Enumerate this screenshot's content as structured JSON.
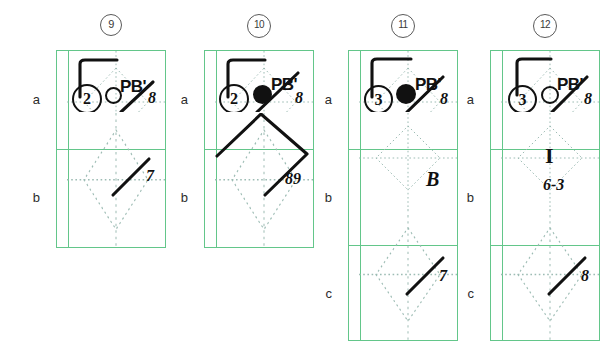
{
  "figure": {
    "title": "",
    "row_labels": [
      "a",
      "b",
      "c"
    ],
    "guide_color": "#9dbcb4",
    "frame_color": "#63c68a",
    "ink_color": "#111111"
  },
  "panels": [
    {
      "number": "9",
      "row_labels": [
        "a",
        "b"
      ],
      "cells": [
        {
          "row": "a",
          "marker_label": "PB'",
          "circled_digit": "2",
          "node_type": "open-circle",
          "corner_number": "8",
          "has_corner_slash": true,
          "has_hook": true,
          "shape": "none"
        },
        {
          "row": "b",
          "marker_label": "",
          "circled_digit": "",
          "node_type": "none",
          "corner_number": "7",
          "has_corner_slash": true,
          "has_hook": false,
          "shape": "none"
        }
      ]
    },
    {
      "number": "10",
      "row_labels": [
        "a",
        "b"
      ],
      "cells": [
        {
          "row": "a",
          "marker_label": "PB'",
          "circled_digit": "2",
          "node_type": "filled-circle",
          "corner_number": "8",
          "has_corner_slash": true,
          "has_hook": true,
          "shape": "none"
        },
        {
          "row": "b",
          "marker_label": "",
          "circled_digit": "",
          "node_type": "none",
          "corner_number": "89",
          "has_corner_slash": true,
          "has_hook": false,
          "shape": "diamond"
        }
      ]
    },
    {
      "number": "11",
      "row_labels": [
        "a",
        "b",
        "c"
      ],
      "cells": [
        {
          "row": "a",
          "marker_label": "PB'",
          "circled_digit": "3",
          "node_type": "filled-circle",
          "corner_number": "8",
          "has_corner_slash": true,
          "has_hook": true,
          "shape": "none"
        },
        {
          "row": "b",
          "marker_label": "",
          "circled_digit": "",
          "node_type": "none",
          "corner_number": "",
          "has_corner_slash": false,
          "has_hook": false,
          "shape": "none",
          "center_text": "B"
        },
        {
          "row": "c",
          "marker_label": "",
          "circled_digit": "",
          "node_type": "none",
          "corner_number": "7",
          "has_corner_slash": true,
          "has_hook": false,
          "shape": "none"
        }
      ]
    },
    {
      "number": "12",
      "row_labels": [
        "a",
        "b",
        "c"
      ],
      "cells": [
        {
          "row": "a",
          "marker_label": "PB'",
          "circled_digit": "3",
          "node_type": "open-circle",
          "corner_number": "8",
          "has_corner_slash": true,
          "has_hook": true,
          "shape": "none"
        },
        {
          "row": "b",
          "marker_label": "",
          "circled_digit": "",
          "node_type": "none",
          "corner_number": "6-3",
          "has_corner_slash": false,
          "has_hook": false,
          "shape": "none",
          "center_text": "I"
        },
        {
          "row": "c",
          "marker_label": "",
          "circled_digit": "",
          "node_type": "none",
          "corner_number": "8",
          "has_corner_slash": true,
          "has_hook": false,
          "shape": "none"
        }
      ]
    }
  ]
}
